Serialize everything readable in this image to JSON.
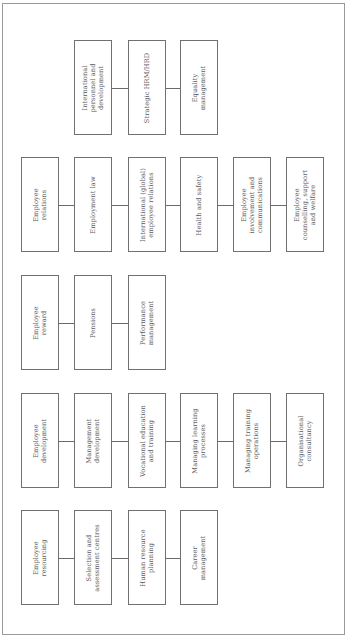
{
  "diagram": {
    "type": "HRM/HRD function map (rotated 90° counter-clockwise)",
    "columns_x": [
      21,
      74,
      128,
      180,
      233,
      286
    ],
    "groups": [
      {
        "id": "strategic",
        "top": 40,
        "start_col": 1,
        "boxes": [
          {
            "label": "International\npersonnel and\ndevelopment"
          },
          {
            "label": "Strategic HRM/HRD"
          },
          {
            "label": "Equality\nmanagement"
          }
        ]
      },
      {
        "id": "relations",
        "top": 157,
        "start_col": 0,
        "boxes": [
          {
            "label": "Employee\nrelations"
          },
          {
            "label": "Employment law"
          },
          {
            "label": "International (global)\nemployee relations"
          },
          {
            "label": "Health and safety"
          },
          {
            "label": "Employee\ninvolvement and\ncommunications"
          },
          {
            "label": "Employee\ncounselling, support\nand welfare"
          }
        ]
      },
      {
        "id": "reward",
        "top": 275,
        "start_col": 0,
        "boxes": [
          {
            "label": "Employee\nreward"
          },
          {
            "label": "Pensions"
          },
          {
            "label": "Performance\nmanagement"
          }
        ]
      },
      {
        "id": "development",
        "top": 393,
        "start_col": 0,
        "boxes": [
          {
            "label": "Employee\ndevelopment"
          },
          {
            "label": "Management\ndevelopment"
          },
          {
            "label": "Vocational education\nand training"
          },
          {
            "label": "Managing learning\nprocesses"
          },
          {
            "label": "Managing training\noperations"
          },
          {
            "label": "Organisational\nconsultancy"
          }
        ]
      },
      {
        "id": "resourcing",
        "top": 510,
        "start_col": 0,
        "boxes": [
          {
            "label": "Employee\nresourcing"
          },
          {
            "label": "Selection and\nassessment centres"
          },
          {
            "label": "Human resource\nplanning"
          },
          {
            "label": "Career\nmanagement"
          }
        ]
      }
    ],
    "colors": {
      "frame": "#9a9a9a",
      "box_border": "#707070",
      "connector": "#6a6a6a",
      "text": "#5a5a5a",
      "background": "#ffffff"
    }
  }
}
